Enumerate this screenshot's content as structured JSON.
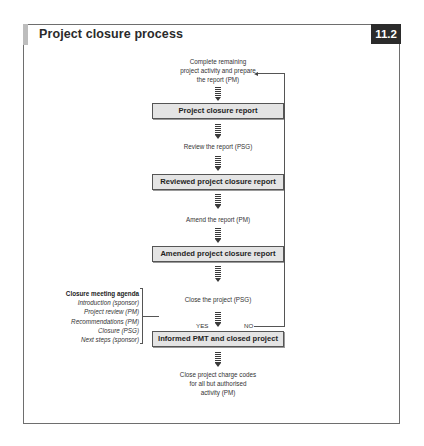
{
  "figure": {
    "title": "Project closure process",
    "number": "11.2"
  },
  "steps": [
    {
      "lines": [
        "Complete remaining",
        "project activity and prepare",
        "the report (PM)"
      ]
    },
    {
      "lines": [
        "Review the report (PSG)"
      ]
    },
    {
      "lines": [
        "Amend the report (PM)"
      ]
    },
    {
      "lines": [
        "Close the project (PSG)"
      ]
    },
    {
      "lines": [
        "Close project charge codes",
        "for all but authorised",
        "activity (PM)"
      ]
    }
  ],
  "outputs": [
    {
      "label": "Project closure report"
    },
    {
      "label": "Reviewed project closure report"
    },
    {
      "label": "Amended project closure report"
    },
    {
      "label": "Informed PMT and closed project"
    }
  ],
  "decision": {
    "yes_label": "YES",
    "no_label": "NO"
  },
  "agenda": {
    "heading": "Closure meeting agenda",
    "items": [
      "Introduction (sponsor)",
      "Project review (PM)",
      "Recommendations (PM)",
      "Closure (PSG)",
      "Next steps (sponsor)"
    ]
  }
}
